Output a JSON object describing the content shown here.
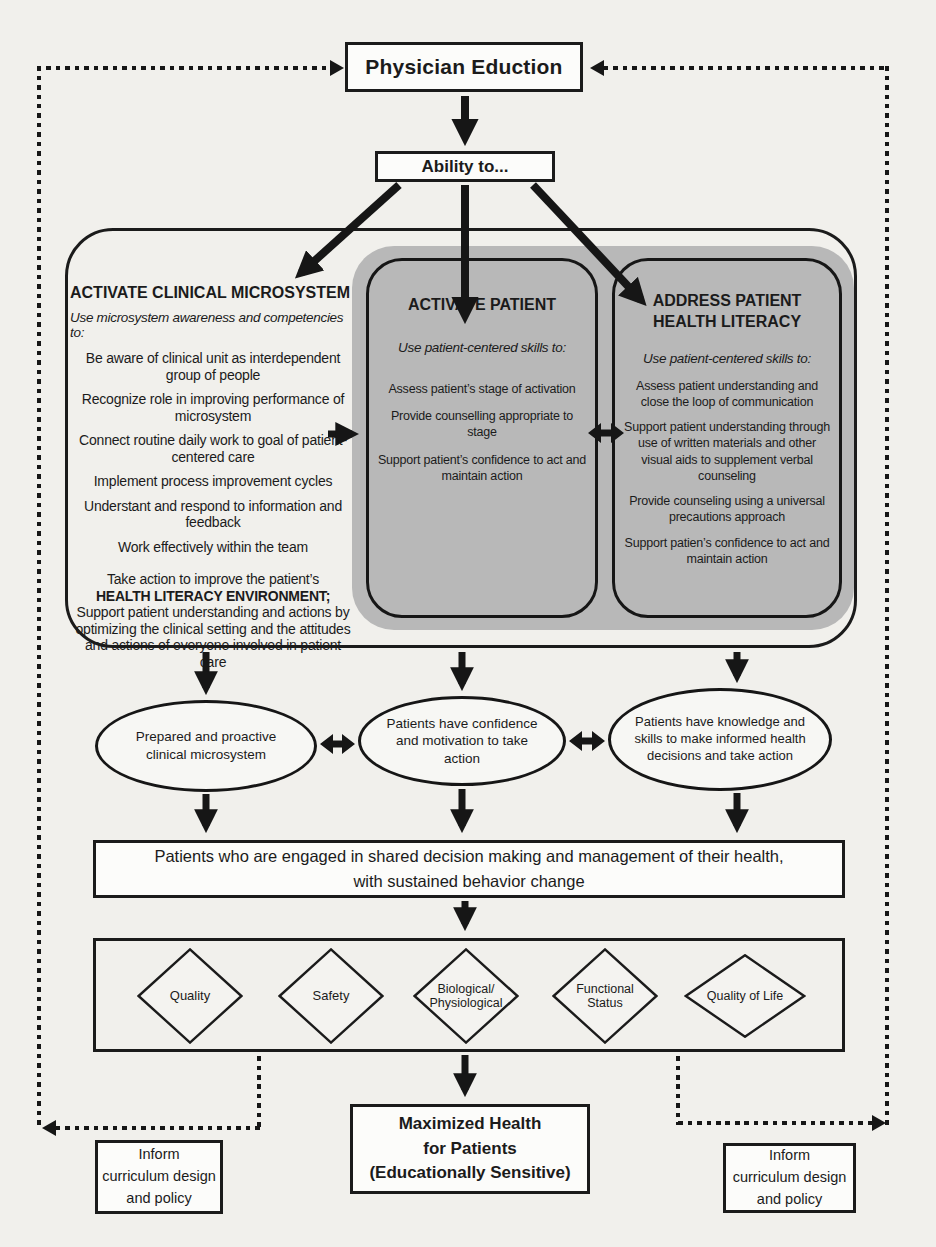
{
  "colors": {
    "ink": "#1b1b1b",
    "paper": "#f1f0ec",
    "panel_gray": "#b8b8b8",
    "box_bg": "#fcfcfa"
  },
  "top": {
    "title": "Physician Eduction",
    "ability": "Ability to..."
  },
  "microsystem": {
    "title": "ACTIVATE CLINICAL MICROSYSTEM",
    "subtitle": "Use microsystem awareness and competencies to:",
    "items": [
      "Be aware of clinical unit as interdependent group of people",
      "Recognize role in improving performance of microsystem",
      "Connect routine daily work to goal of patient-centered care",
      "Implement process improvement cycles",
      "Understant and respond to information and feedback",
      "Work effectively within the team"
    ],
    "closing_lead": "Take action to improve the patient’s",
    "closing_bold": "HEALTH LITERACY ENVIRONMENT;",
    "closing_rest": "Support patient understanding and actions by optimizing the clinical setting and the attitudes and actions of everyone involved in patient care"
  },
  "activate_patient": {
    "title": "ACTIVATE PATIENT",
    "subtitle": "Use patient-centered skills to:",
    "items": [
      "Assess patient’s stage of activation",
      "Provide counselling appropriate to stage",
      "Support patient’s confidence to act and maintain action"
    ]
  },
  "health_literacy": {
    "title_line1": "ADDRESS PATIENT",
    "title_line2": "HEALTH LITERACY",
    "subtitle": "Use patient-centered skills to:",
    "items": [
      "Assess patient understanding and close the loop of communication",
      "Support patient understanding through use of written materials and other visual aids to supplement verbal counseling",
      "Provide counseling using a universal precautions approach",
      "Support patien’s confidence to act and maintain action"
    ]
  },
  "ellipses": [
    "Prepared and proactive clinical microsystem",
    "Patients have confidence and motivation to take action",
    "Patients have knowledge and skills to make informed health decisions and take action"
  ],
  "engaged": {
    "line1": "Patients who are engaged in shared decision making and management of their health,",
    "line2": "with sustained behavior change"
  },
  "diamonds": [
    {
      "line1": "Quality",
      "line2": ""
    },
    {
      "line1": "Safety",
      "line2": ""
    },
    {
      "line1": "Biological/",
      "line2": "Physiological"
    },
    {
      "line1": "Functional",
      "line2": "Status"
    },
    {
      "line1": "Quality of Life",
      "line2": ""
    }
  ],
  "maximized": {
    "line1": "Maximized Health",
    "line2": "for Patients",
    "line3": "(Educationally Sensitive)"
  },
  "inform_left": {
    "line1": "Inform",
    "line2": "curriculum design",
    "line3": "and policy"
  },
  "inform_right": {
    "line1": "Inform",
    "line2": "curriculum design",
    "line3": "and policy"
  }
}
